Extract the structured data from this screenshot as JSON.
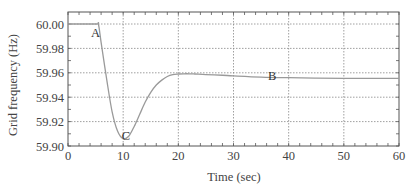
{
  "chart_data": {
    "type": "line",
    "title": "",
    "xlabel": "Time (sec)",
    "ylabel": "Grid frequency (Hz)",
    "xlim": [
      0,
      60
    ],
    "ylim": [
      59.9,
      60.01
    ],
    "xticks": [
      0,
      10,
      20,
      30,
      40,
      50,
      60
    ],
    "xtick_labels": [
      "0",
      "10",
      "20",
      "30",
      "40",
      "50",
      "60"
    ],
    "yticks": [
      59.9,
      59.92,
      59.94,
      59.96,
      59.98,
      60.0
    ],
    "ytick_labels": [
      "59.90",
      "59.92",
      "59.94",
      "59.96",
      "59.98",
      "60.00"
    ],
    "grid": true,
    "legend": null,
    "series": [
      {
        "name": "Grid frequency",
        "color": "#9a9a9a",
        "x": [
          0,
          5,
          5.5,
          6,
          7,
          8,
          9,
          10,
          11,
          12,
          13,
          14,
          15,
          16,
          17,
          18,
          19,
          20,
          21,
          22,
          23,
          25,
          28,
          30,
          35,
          40,
          45,
          50,
          55,
          60
        ],
        "y": [
          60.0,
          60.0,
          60.0,
          59.985,
          59.955,
          59.928,
          59.912,
          59.906,
          59.908,
          59.916,
          59.926,
          59.936,
          59.944,
          59.95,
          59.954,
          59.957,
          59.9585,
          59.959,
          59.9592,
          59.9592,
          59.959,
          59.9585,
          59.958,
          59.9575,
          59.9565,
          59.956,
          59.9557,
          59.9555,
          59.9555,
          59.9555
        ]
      }
    ],
    "annotations": [
      {
        "label": "A",
        "x": 5.0,
        "y": 59.9925
      },
      {
        "label": "B",
        "x": 37.0,
        "y": 59.957
      },
      {
        "label": "C",
        "x": 10.5,
        "y": 59.908
      }
    ]
  }
}
